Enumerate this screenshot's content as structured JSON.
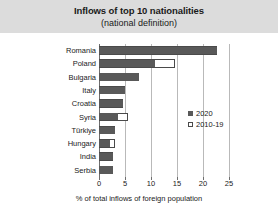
{
  "chart_data": {
    "type": "bar",
    "orientation": "horizontal",
    "title": "Inflows of top 10 nationalities",
    "subtitle": "(national definition)",
    "xlabel": "% of total inflows of foreign population",
    "ylabel": "",
    "xlim": [
      0,
      25
    ],
    "xticks": [
      0,
      5,
      10,
      15,
      20,
      25
    ],
    "xtick_labels": [
      "0",
      "5",
      "10",
      "15",
      "20",
      "25"
    ],
    "grid": true,
    "grid_axis": "x",
    "legend_position": "right-inside",
    "categories": [
      "Romania",
      "Poland",
      "Bulgaria",
      "Italy",
      "Croatia",
      "Syria",
      "Türkiye",
      "Hungary",
      "India",
      "Serbia"
    ],
    "series": [
      {
        "name": "2020",
        "style": "solid",
        "color": "#595959",
        "values": [
          22.7,
          10.8,
          7.7,
          5.0,
          4.6,
          3.6,
          3.0,
          2.1,
          2.7,
          2.7
        ]
      },
      {
        "name": "2010-19",
        "style": "open",
        "color": "#ffffff",
        "values": [
          22.7,
          14.6,
          7.7,
          5.0,
          4.6,
          5.6,
          3.0,
          3.1,
          2.7,
          2.7
        ]
      }
    ]
  },
  "legend": {
    "items": [
      {
        "label": "2020",
        "style": "solid"
      },
      {
        "label": "2010-19",
        "style": "open"
      }
    ]
  },
  "colors": {
    "title_band": "#dcdcdc",
    "bar_solid": "#595959",
    "bar_open_edge": "#4a4a4a",
    "gridline": "#b9b9b9",
    "axis": "#6e6e6e",
    "text": "#1a1a1a"
  }
}
